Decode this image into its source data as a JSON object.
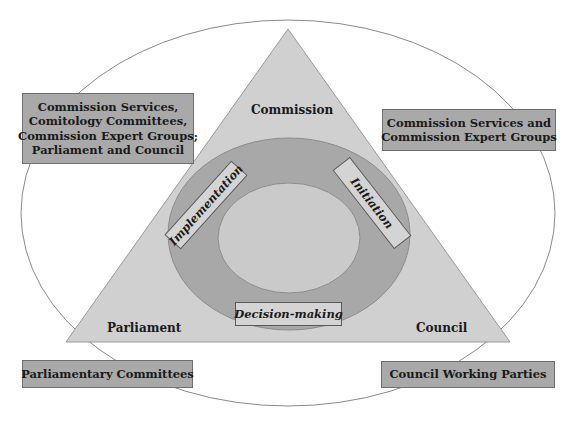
{
  "colors": {
    "background": "#ffffff",
    "outer_ellipse_stroke": "#8a8a8a",
    "triangle_fill": "#d0d0d0",
    "ring_fill": "#a8a8a8",
    "inner_fill": "#cacaca",
    "box_fill": "#a9a9a9",
    "phase_box_fill": "#d4d4d4"
  },
  "triangle": {
    "vertices": {
      "top": "Commission",
      "bottom_left": "Parliament",
      "bottom_right": "Council"
    }
  },
  "cycle": {
    "phases": {
      "left": "Implementation",
      "right": "Initiation",
      "bottom": "Decision-making"
    }
  },
  "boxes": {
    "top_left": {
      "lines": [
        "Commission Services,",
        "Comitology Committees,",
        "Commission Expert Groups;",
        "Parliament and Council"
      ]
    },
    "top_right": {
      "lines": [
        "Commission Services and",
        "Commission Expert Groups"
      ]
    },
    "bottom_left": {
      "lines": [
        "Parliamentary Committees"
      ]
    },
    "bottom_right": {
      "lines": [
        "Council Working Parties"
      ]
    }
  }
}
